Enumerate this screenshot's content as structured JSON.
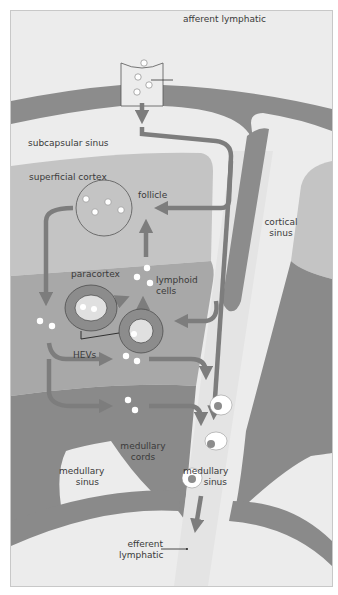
{
  "diagram": {
    "type": "lymph-node-lymphocyte-traffic",
    "colors": {
      "background": "#ececec",
      "capsule": "#8c8c8c",
      "cortex_light": "#c4c4c4",
      "paracortex": "#a8a8a8",
      "medulla_dark": "#8a8a8a",
      "sinus_light": "#e4e4e4",
      "arrow": "#7d7d7d",
      "cell_white": "#ffffff",
      "outline": "#555555"
    },
    "labels": {
      "afferent_lymphatic": "afferent lymphatic",
      "subcapsular_sinus": "subcapsular sinus",
      "superficial_cortex": "superficial cortex",
      "follicle": "follicle",
      "cortical_sinus_1": "cortical",
      "cortical_sinus_2": "sinus",
      "paracortex": "paracortex",
      "lymphoid_cells_1": "lymphoid",
      "lymphoid_cells_2": "cells",
      "hevs": "HEVs",
      "medullary_cords_1": "medullary",
      "medullary_cords_2": "cords",
      "medullary_sinus_left_1": "medullary",
      "medullary_sinus_left_2": "sinus",
      "medullary_sinus_right_1": "medullary",
      "medullary_sinus_right_2": "sinus",
      "efferent_lymphatic_1": "efferent",
      "efferent_lymphatic_2": "lymphatic"
    }
  }
}
